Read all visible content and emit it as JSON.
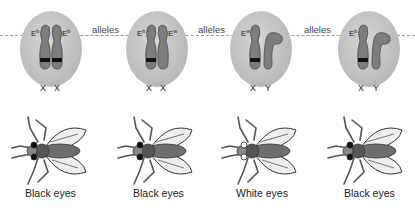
{
  "figure": {
    "connector_label": "alleles",
    "panels": [
      {
        "id": "female-homozygous-black",
        "chromosome_left": {
          "gene": "E",
          "allele": "b",
          "type": "X",
          "band": true
        },
        "chromosome_right": {
          "gene": "E",
          "allele": "b",
          "type": "X",
          "band": true
        },
        "phenotype": "Black eyes",
        "eye_color": "#111111"
      },
      {
        "id": "female-heterozygous",
        "chromosome_left": {
          "gene": "E",
          "allele": "b",
          "type": "X",
          "band": true
        },
        "chromosome_right": {
          "gene": "E",
          "allele": "w",
          "type": "X",
          "band": false
        },
        "phenotype": "Black eyes",
        "eye_color": "#111111"
      },
      {
        "id": "male-white",
        "chromosome_left": {
          "gene": "E",
          "allele": "w",
          "type": "X",
          "band": true
        },
        "chromosome_right": {
          "gene": "",
          "allele": "",
          "type": "Y",
          "band": false
        },
        "phenotype": "White eyes",
        "eye_color": "#ffffff"
      },
      {
        "id": "male-black",
        "chromosome_left": {
          "gene": "E",
          "allele": "b",
          "type": "X",
          "band": true
        },
        "chromosome_right": {
          "gene": "",
          "allele": "",
          "type": "Y",
          "band": false
        },
        "phenotype": "Black eyes",
        "eye_color": "#111111"
      }
    ],
    "colors": {
      "oval": "#bdbdbd",
      "chromosome": "#7d7d7d",
      "chromosome_outline": "#4a4a4a",
      "band": "#111111",
      "dashed_line": "#9a9a9a"
    }
  }
}
